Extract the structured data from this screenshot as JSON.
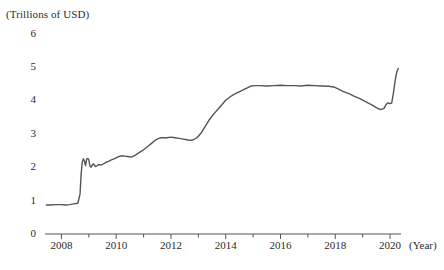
{
  "chart_data": {
    "type": "line",
    "title": "",
    "subtitle": "",
    "xlabel": "(Year)",
    "ylabel": "(Trillions of USD)",
    "unit_note": "(Trillions of USD)",
    "xlim": [
      2007.4,
      2020.4
    ],
    "ylim": [
      0,
      6
    ],
    "grid": false,
    "legend": "none",
    "line_color": "#555555",
    "axis_color": "#555555",
    "y_ticks": [
      0,
      1,
      2,
      3,
      4,
      5,
      6
    ],
    "y_tick_labels": [
      "0",
      "1",
      "2",
      "3",
      "4",
      "5",
      "6"
    ],
    "x_ticks": [
      2008,
      2009,
      2010,
      2011,
      2012,
      2013,
      2014,
      2015,
      2016,
      2017,
      2018,
      2019,
      2020
    ],
    "x_tick_labels": [
      "2008",
      "",
      "2010",
      "",
      "2012",
      "",
      "2014",
      "",
      "2016",
      "",
      "2018",
      "",
      "2020"
    ],
    "x_major_labeled": [
      "2008",
      "2010",
      "2012",
      "2014",
      "2016",
      "2018",
      "2020"
    ],
    "series": [
      {
        "name": "Federal Reserve total assets",
        "x": [
          2007.45,
          2007.6,
          2007.8,
          2008.0,
          2008.15,
          2008.3,
          2008.45,
          2008.6,
          2008.68,
          2008.72,
          2008.76,
          2008.8,
          2008.84,
          2008.88,
          2008.92,
          2008.96,
          2009.0,
          2009.04,
          2009.08,
          2009.12,
          2009.16,
          2009.2,
          2009.24,
          2009.3,
          2009.36,
          2009.42,
          2009.5,
          2009.58,
          2009.66,
          2009.74,
          2009.82,
          2009.9,
          2010.0,
          2010.1,
          2010.2,
          2010.3,
          2010.42,
          2010.55,
          2010.7,
          2010.85,
          2011.0,
          2011.15,
          2011.3,
          2011.45,
          2011.55,
          2011.65,
          2011.75,
          2011.85,
          2012.0,
          2012.15,
          2012.3,
          2012.45,
          2012.58,
          2012.7,
          2012.82,
          2012.95,
          2013.1,
          2013.25,
          2013.4,
          2013.55,
          2013.7,
          2013.85,
          2014.0,
          2014.15,
          2014.3,
          2014.45,
          2014.6,
          2014.75,
          2014.9,
          2015.05,
          2015.25,
          2015.5,
          2015.75,
          2016.0,
          2016.25,
          2016.5,
          2016.75,
          2017.0,
          2017.25,
          2017.5,
          2017.75,
          2017.95,
          2018.1,
          2018.3,
          2018.5,
          2018.7,
          2018.9,
          2019.1,
          2019.3,
          2019.5,
          2019.65,
          2019.78,
          2019.86,
          2019.92,
          2020.0,
          2020.06,
          2020.12,
          2020.18,
          2020.22,
          2020.26,
          2020.3
        ],
        "y": [
          0.87,
          0.87,
          0.88,
          0.88,
          0.87,
          0.88,
          0.9,
          0.92,
          1.2,
          1.8,
          2.15,
          2.25,
          2.18,
          2.05,
          2.24,
          2.26,
          2.22,
          2.04,
          2.0,
          2.05,
          2.1,
          2.07,
          2.02,
          2.04,
          2.08,
          2.06,
          2.08,
          2.12,
          2.16,
          2.18,
          2.22,
          2.24,
          2.28,
          2.32,
          2.34,
          2.33,
          2.32,
          2.3,
          2.36,
          2.44,
          2.52,
          2.62,
          2.72,
          2.82,
          2.86,
          2.88,
          2.88,
          2.88,
          2.9,
          2.88,
          2.86,
          2.84,
          2.82,
          2.8,
          2.82,
          2.88,
          3.02,
          3.22,
          3.42,
          3.58,
          3.72,
          3.86,
          4.0,
          4.1,
          4.18,
          4.24,
          4.3,
          4.36,
          4.42,
          4.44,
          4.44,
          4.43,
          4.44,
          4.45,
          4.44,
          4.44,
          4.43,
          4.45,
          4.44,
          4.43,
          4.42,
          4.4,
          4.34,
          4.26,
          4.2,
          4.12,
          4.05,
          3.96,
          3.88,
          3.78,
          3.72,
          3.76,
          3.88,
          3.92,
          3.9,
          3.92,
          4.2,
          4.55,
          4.75,
          4.88,
          4.95
        ]
      }
    ],
    "annotations": []
  },
  "labels": {
    "unit": "(Trillions of USD)",
    "year": "(Year)"
  }
}
